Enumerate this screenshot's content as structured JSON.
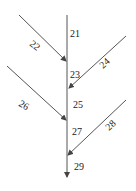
{
  "diagram": {
    "type": "stream-network",
    "line_color": "#555555",
    "text_color": "#222222",
    "main_stem": {
      "x": 67,
      "y_start": 15,
      "y_end": 177
    },
    "links": [
      {
        "id": "21",
        "label": "21",
        "label_pos": [
          70,
          37
        ]
      },
      {
        "id": "22",
        "label": "22",
        "from": [
          19,
          15
        ],
        "to": [
          66,
          61
        ],
        "label_pos": [
          34,
          48
        ],
        "rotate": 40
      },
      {
        "id": "23",
        "label": "23",
        "label_pos": [
          70,
          78
        ]
      },
      {
        "id": "24",
        "label": "24",
        "from": [
          126,
          36
        ],
        "to": [
          69,
          88
        ],
        "label_pos": [
          104,
          66
        ],
        "rotate": -42
      },
      {
        "id": "25",
        "label": "25",
        "label_pos": [
          73,
          108
        ]
      },
      {
        "id": "26",
        "label": "26",
        "from": [
          7,
          66
        ],
        "to": [
          66,
          120
        ],
        "label_pos": [
          23,
          108
        ],
        "rotate": 30
      },
      {
        "id": "27",
        "label": "27",
        "label_pos": [
          72,
          135
        ]
      },
      {
        "id": "28",
        "label": "28",
        "from": [
          126,
          100
        ],
        "to": [
          68,
          155
        ],
        "label_pos": [
          110,
          128
        ],
        "rotate": -42
      },
      {
        "id": "29",
        "label": "29",
        "label_pos": [
          74,
          170
        ]
      }
    ]
  }
}
